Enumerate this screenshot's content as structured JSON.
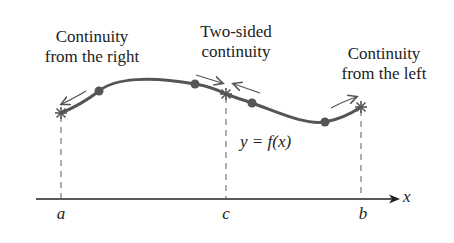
{
  "labels": {
    "right": [
      "Continuity",
      "from the right"
    ],
    "two_sided": [
      "Two-sided",
      "continuity"
    ],
    "left": [
      "Continuity",
      "from the left"
    ],
    "function": "y = f(x)"
  },
  "axis": {
    "x_label": "x",
    "ticks": [
      {
        "name": "a",
        "label": "a"
      },
      {
        "name": "c",
        "label": "c"
      },
      {
        "name": "b",
        "label": "b"
      }
    ]
  },
  "colors": {
    "curve": "#555555",
    "axis": "#222222",
    "dashed": "#777777",
    "text": "#222222"
  }
}
